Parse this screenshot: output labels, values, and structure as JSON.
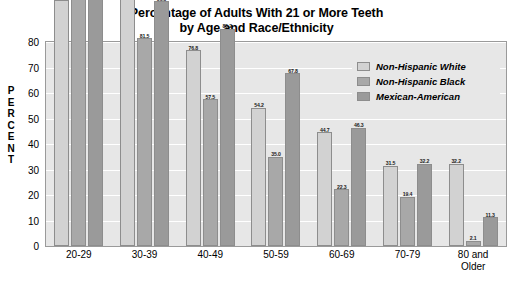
{
  "chart_data": {
    "type": "bar",
    "title": "Percentage of Adults With 21 or More Teeth by Age and Race/Ethnicity",
    "title_line1": "Percentage of Adults With 21 or More Teeth",
    "title_line2": "by Age and Race/Ethnicity",
    "xlabel": "",
    "ylabel": "PERCENT",
    "ylim": [
      0,
      80
    ],
    "yticks": [
      0,
      10,
      20,
      30,
      40,
      50,
      60,
      70,
      80
    ],
    "ytick_labels": [
      "0",
      "10",
      "20",
      "30",
      "40",
      "50",
      "60",
      "70",
      "80"
    ],
    "grid": true,
    "legend_position": "top-right",
    "categories": [
      "20-29",
      "30-39",
      "40-49",
      "50-59",
      "60-69",
      "70-79",
      "80 and Older"
    ],
    "category_lines": [
      [
        "20-29"
      ],
      [
        "30-39"
      ],
      [
        "40-49"
      ],
      [
        "50-59"
      ],
      [
        "60-69"
      ],
      [
        "70-79"
      ],
      [
        "80 and",
        "Older"
      ]
    ],
    "series": [
      {
        "name": "Non-Hispanic White",
        "color": "#d2d2d2",
        "values": [
          96.5,
          99.2,
          76.8,
          54.2,
          44.7,
          31.5,
          32.2
        ],
        "labels": [
          "96.5",
          "99.2",
          "76.8",
          "54.2",
          "44.7",
          "31.5",
          "32.2"
        ]
      },
      {
        "name": "Non-Hispanic Black",
        "color": "#a8a8a8",
        "values": [
          97.8,
          81.5,
          57.5,
          35.0,
          22.3,
          19.4,
          2.1
        ],
        "labels": [
          "97.8",
          "81.5",
          "57.5",
          "35.0",
          "22.3",
          "19.4",
          "2.1"
        ]
      },
      {
        "name": "Mexican-American",
        "color": "#9a9a9a",
        "values": [
          99.2,
          96.0,
          85.2,
          67.8,
          46.3,
          32.2,
          11.3
        ],
        "labels": [
          "99.2",
          "96.0",
          "85.2",
          "67.8",
          "46.3",
          "32.2",
          "11.3"
        ]
      }
    ]
  },
  "legend": {
    "items": [
      {
        "label": "Non-Hispanic White",
        "color": "#d2d2d2"
      },
      {
        "label": "Non-Hispanic Black",
        "color": "#a8a8a8"
      },
      {
        "label": "Mexican-American",
        "color": "#9a9a9a"
      }
    ]
  },
  "colors": {
    "plot_background": "#e7e7e7",
    "page_background": "#ffffff",
    "gridline": "#ffffff",
    "frame_border": "#9a9a9a",
    "text": "#000000"
  }
}
